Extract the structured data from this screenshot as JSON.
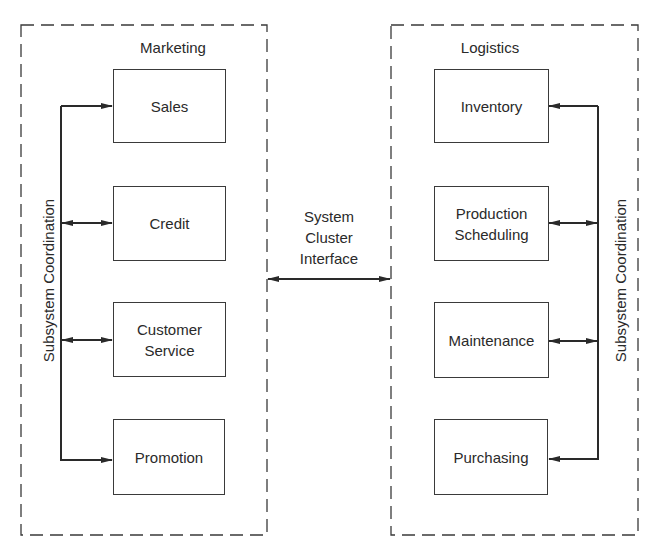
{
  "diagram": {
    "left_cluster": {
      "title": "Marketing",
      "coordination_label": "Subsystem Coordination",
      "subsystems": [
        {
          "label": "Sales",
          "arrow": "to-box"
        },
        {
          "label": "Credit",
          "arrow": "bidirectional"
        },
        {
          "label": "Customer Service",
          "line1": "Customer",
          "line2": "Service",
          "arrow": "bidirectional"
        },
        {
          "label": "Promotion",
          "arrow": "to-box"
        }
      ]
    },
    "right_cluster": {
      "title": "Logistics",
      "coordination_label": "Subsystem Coordination",
      "subsystems": [
        {
          "label": "Inventory",
          "arrow": "to-box"
        },
        {
          "label": "Production Scheduling",
          "line1": "Production",
          "line2": "Scheduling",
          "arrow": "bidirectional"
        },
        {
          "label": "Maintenance",
          "arrow": "bidirectional"
        },
        {
          "label": "Purchasing",
          "arrow": "to-box"
        }
      ]
    },
    "interface": {
      "line1": "System",
      "line2": "Cluster",
      "line3": "Interface",
      "arrow": "bidirectional"
    },
    "colors": {
      "stroke": "#2a2a2a",
      "background": "#ffffff"
    }
  }
}
